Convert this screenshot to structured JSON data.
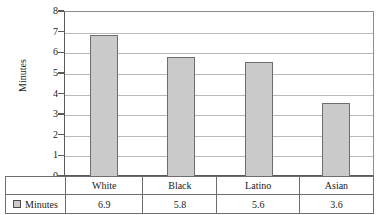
{
  "chart_data": {
    "type": "bar",
    "title": "",
    "xlabel": "",
    "ylabel": "Minutes",
    "categories": [
      "White",
      "Black",
      "Latino",
      "Asian"
    ],
    "values": [
      6.9,
      5.8,
      5.6,
      3.6
    ],
    "series": [
      {
        "name": "Minutes",
        "values": [
          6.9,
          5.8,
          5.6,
          3.6
        ]
      }
    ],
    "ylim": [
      0,
      8
    ],
    "y_ticks": [
      0,
      1,
      2,
      3,
      4,
      5,
      6,
      7,
      8
    ],
    "y_tick_labels": [
      "0",
      "1",
      "2",
      "3",
      "4",
      "5",
      "6",
      "7",
      "8"
    ],
    "grid": true,
    "legend_position": "bottom-table",
    "bar_color": "#cacaca",
    "bar_border_color": "#6e6e6e",
    "gridline_color": "#b9b9b9",
    "axis_color": "#5a5a5a"
  },
  "legend": {
    "swatch_name": "series-swatch-minutes",
    "label": "Minutes"
  },
  "table": {
    "category_row": [
      "White",
      "Black",
      "Latino",
      "Asian"
    ],
    "value_row": [
      "6.9",
      "5.8",
      "5.6",
      "3.6"
    ]
  }
}
